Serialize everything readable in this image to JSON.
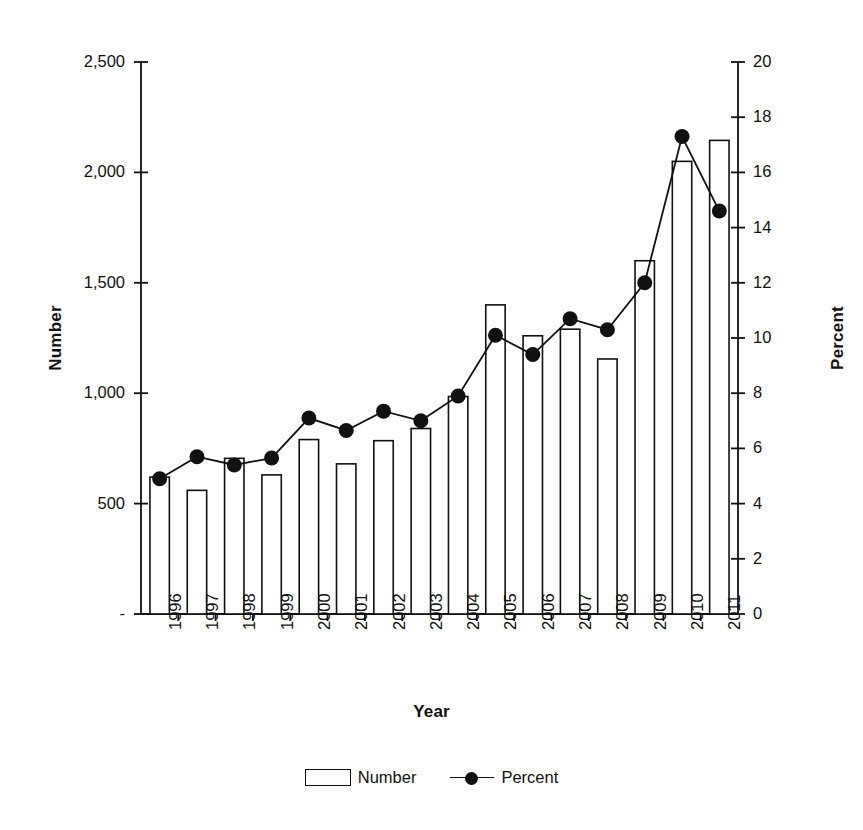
{
  "chart_data": {
    "type": "bar",
    "title": "",
    "xlabel": "Year",
    "ylabel": "Number",
    "y2label": "Percent",
    "grid": false,
    "legend_position": "bottom-center",
    "categories": [
      "1996",
      "1997",
      "1998",
      "1999",
      "2000",
      "2001",
      "2002",
      "2003",
      "2004",
      "2005",
      "2006",
      "2007",
      "2008",
      "2009",
      "2010",
      "2011"
    ],
    "ylim": [
      0,
      2500
    ],
    "y2lim": [
      0,
      20
    ],
    "yticks": [
      "-",
      "500",
      "1,000",
      "1,500",
      "2,000",
      "2,500"
    ],
    "ytick_values": [
      0,
      500,
      1000,
      1500,
      2000,
      2500
    ],
    "y2ticks": [
      "0",
      "2",
      "4",
      "6",
      "8",
      "10",
      "12",
      "14",
      "16",
      "18",
      "20"
    ],
    "y2tick_values": [
      0,
      2,
      4,
      6,
      8,
      10,
      12,
      14,
      16,
      18,
      20
    ],
    "series": [
      {
        "name": "Number",
        "axis": "left",
        "render": "bar",
        "values": [
          620,
          560,
          705,
          630,
          790,
          680,
          785,
          840,
          985,
          1400,
          1260,
          1290,
          1155,
          1600,
          2050,
          2145
        ]
      },
      {
        "name": "Percent",
        "axis": "right",
        "render": "line-marker",
        "values": [
          4.9,
          5.7,
          5.4,
          5.65,
          7.1,
          6.65,
          7.35,
          7.0,
          7.9,
          10.1,
          9.4,
          10.7,
          10.3,
          12.0,
          17.3,
          14.6
        ]
      }
    ],
    "legend": [
      "Number",
      "Percent"
    ],
    "colors": {
      "axis": "#111111",
      "bar_fill": "#ffffff",
      "bar_stroke": "#111111",
      "line": "#111111",
      "marker": "#111111"
    }
  }
}
